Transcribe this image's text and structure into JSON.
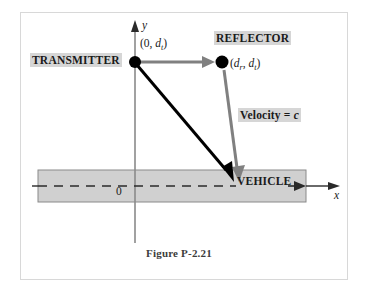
{
  "figure": {
    "caption": "Figure P-2.21",
    "border_color": "#d8d8d8",
    "background": "#ffffff"
  },
  "axes": {
    "x_label": "x",
    "y_label": "y",
    "origin_label": "0",
    "axis_color": "#8a8a8a",
    "x_axis_arrow": "right-arrow",
    "y_axis_arrow": "up-arrow"
  },
  "labels": {
    "transmitter": "TRANSMITTER",
    "reflector": "REFLECTOR",
    "vehicle": "VEHICLE",
    "velocity": "Velocity = c",
    "velocity_prefix": "Velocity = ",
    "velocity_value": "c",
    "transmitter_coord_open": "(0, ",
    "transmitter_coord_var": "d",
    "transmitter_coord_sub": "t",
    "transmitter_coord_close": ")",
    "reflector_coord_open": "(",
    "reflector_coord_var1": "d",
    "reflector_coord_sub1": "r",
    "reflector_coord_mid": ", ",
    "reflector_coord_var2": "d",
    "reflector_coord_sub2": "t",
    "reflector_coord_close": ")",
    "highlight_color": "#d6d6d6"
  },
  "road": {
    "fill": "#d0d0d0",
    "stroke": "#8a8a8a",
    "centerline_style": "dashed",
    "vehicle_arrow": "right-arrow"
  },
  "markers": {
    "transmitter_dot": "filled-circle",
    "reflector_dot": "filled-circle",
    "dot_color": "#000000"
  },
  "rays": [
    {
      "name": "transmitter-to-reflector",
      "color": "#808080",
      "from": "TRANSMITTER",
      "to": "REFLECTOR",
      "arrowhead": "at-reflector"
    },
    {
      "name": "reflector-to-vehicle",
      "color": "#808080",
      "from": "REFLECTOR",
      "to": "VEHICLE",
      "arrowhead": "at-vehicle"
    },
    {
      "name": "transmitter-to-vehicle",
      "color": "#000000",
      "from": "TRANSMITTER",
      "to": "VEHICLE",
      "arrowhead": "at-vehicle"
    }
  ]
}
